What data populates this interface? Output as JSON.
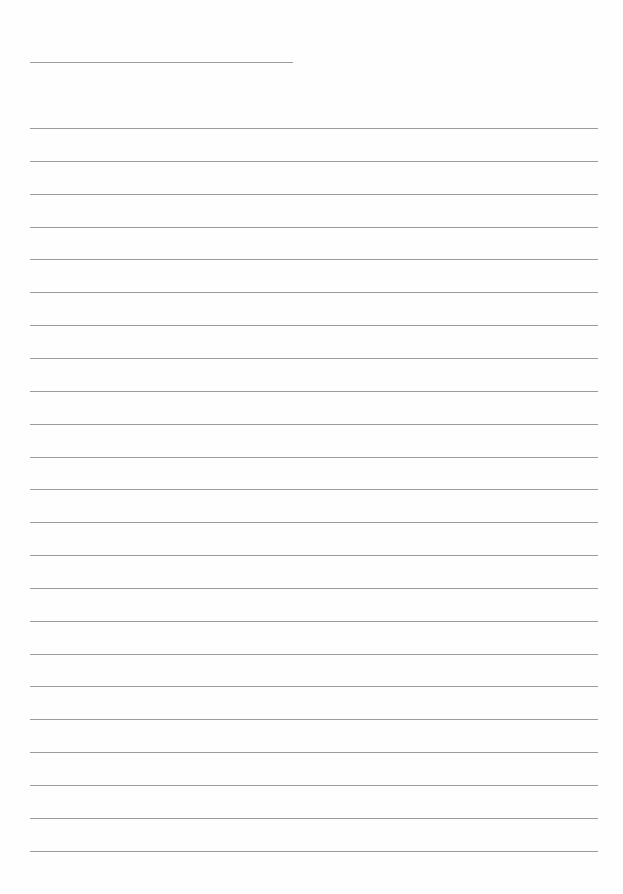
{
  "page": {
    "type": "lined-writing-paper",
    "background_color": "#fefefe",
    "line_color": "#8a8a8a",
    "header_line": {
      "x1": 30,
      "x2": 293,
      "y": 62
    },
    "ruled_lines": {
      "count": 23,
      "x1": 30,
      "x2": 598,
      "first_y": 128,
      "spacing": 32.85
    }
  }
}
